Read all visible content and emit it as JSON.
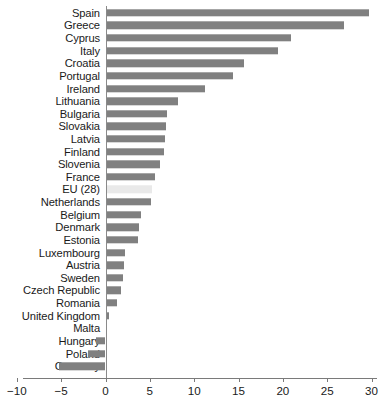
{
  "chart_data": {
    "type": "bar",
    "orientation": "horizontal",
    "title": "",
    "subtitle": "",
    "xlabel": "",
    "ylabel": "",
    "xlim": [
      -10,
      30
    ],
    "xticks": [
      -10,
      -5,
      0,
      5,
      10,
      15,
      20,
      25,
      30
    ],
    "xticklabels": [
      "−10",
      "−5",
      "0",
      "5",
      "10",
      "15",
      "20",
      "25",
      "30"
    ],
    "grid": false,
    "legend": false,
    "bar_color": "#808080",
    "highlight_color": "#e9e9e9",
    "highlight_category": "EU (28)",
    "categories": [
      "Spain",
      "Greece",
      "Cyprus",
      "Italy",
      "Croatia",
      "Portugal",
      "Ireland",
      "Lithuania",
      "Bulgaria",
      "Slovakia",
      "Latvia",
      "Finland",
      "Slovenia",
      "France",
      "EU (28)",
      "Netherlands",
      "Belgium",
      "Denmark",
      "Estonia",
      "Luxembourg",
      "Austria",
      "Sweden",
      "Czech Republic",
      "Romania",
      "United Kingdom",
      "Malta",
      "Hungary",
      "Poland",
      "Germany"
    ],
    "values": [
      29.7,
      26.9,
      20.9,
      19.4,
      15.6,
      14.4,
      11.2,
      8.2,
      6.9,
      6.8,
      6.7,
      6.6,
      6.1,
      5.6,
      5.2,
      5.1,
      4.0,
      3.8,
      3.7,
      2.2,
      2.1,
      2.0,
      1.8,
      1.3,
      0.4,
      0.0,
      -1.1,
      -2.0,
      -5.2
    ]
  }
}
